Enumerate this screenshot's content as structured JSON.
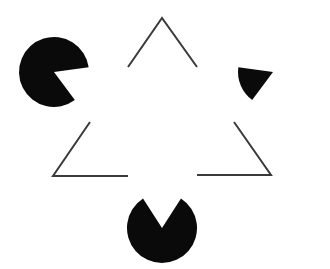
{
  "figure": {
    "title": "Kanizsa triangle illusion",
    "background": "#ffffff",
    "pacman_color": "#0a0a0a",
    "line_color": "#3a3a3a",
    "line_width": 2,
    "pacmen": [
      {
        "name": "top-left",
        "cx": 54,
        "cy": 72,
        "r": 35,
        "mouth": [
          [
            91,
            67
          ],
          [
            74,
            99
          ]
        ]
      },
      {
        "name": "top-right",
        "cx": 273,
        "cy": 72,
        "r": 35,
        "mouth": [
          [
            236,
            67
          ],
          [
            253,
            99
          ]
        ]
      },
      {
        "name": "bottom",
        "cx": 162,
        "cy": 228,
        "r": 35,
        "mouth": [
          [
            142,
            197
          ],
          [
            182,
            197
          ]
        ]
      }
    ],
    "outline_corners": [
      {
        "name": "top-apex",
        "points": [
          [
            128,
            67
          ],
          [
            162,
            18
          ],
          [
            197,
            67
          ]
        ]
      },
      {
        "name": "bottom-left",
        "points": [
          [
            90,
            122
          ],
          [
            53,
            176
          ],
          [
            128,
            176
          ]
        ]
      },
      {
        "name": "bottom-right",
        "points": [
          [
            234,
            122
          ],
          [
            271,
            175
          ],
          [
            197,
            175
          ]
        ]
      }
    ]
  }
}
